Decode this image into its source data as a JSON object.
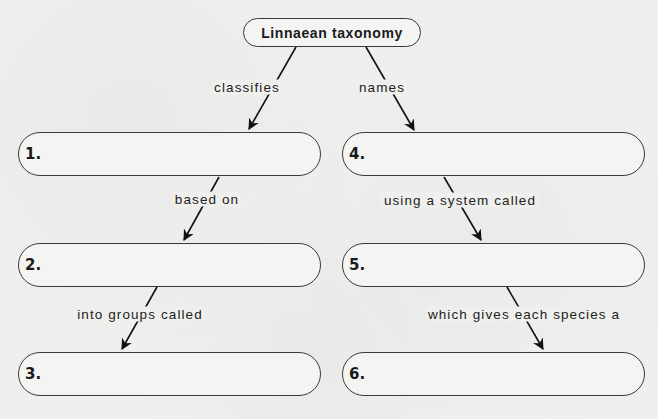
{
  "root": {
    "label": "Linnaean taxonomy"
  },
  "branches": {
    "left": {
      "edge_label": "classifies",
      "nodes": [
        {
          "number": "1.",
          "value": ""
        },
        {
          "number": "2.",
          "value": ""
        },
        {
          "number": "3.",
          "value": ""
        }
      ],
      "links": [
        "based on",
        "into groups called"
      ]
    },
    "right": {
      "edge_label": "names",
      "nodes": [
        {
          "number": "4.",
          "value": ""
        },
        {
          "number": "5.",
          "value": ""
        },
        {
          "number": "6.",
          "value": ""
        }
      ],
      "links": [
        "using a system called",
        "which gives each species a"
      ]
    }
  },
  "colors": {
    "stroke": "#3a3a3a",
    "text": "#1a1a1a",
    "background": "#efefed"
  }
}
